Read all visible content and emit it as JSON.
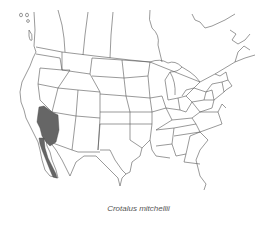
{
  "map": {
    "region": "North America (USA, southern Canada, northern Mexico)",
    "line_color": "#555555",
    "range_fill": "#666666",
    "range_label": "Crotalus mitchellii range"
  },
  "caption": "Crotalus mitchellii"
}
